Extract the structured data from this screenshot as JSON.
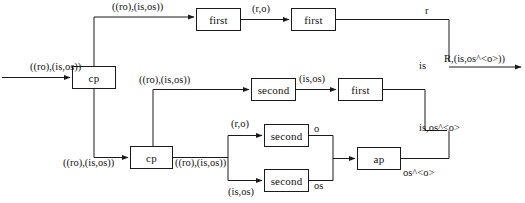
{
  "diagram": {
    "type": "dataflow",
    "stroke_color": "#1a1a1a",
    "background_color": "#ffffff",
    "nodes": [
      {
        "id": "cp1",
        "label": "cp",
        "x": 72,
        "y": 66,
        "w": 44,
        "h": 23
      },
      {
        "id": "first1",
        "label": "first",
        "x": 196,
        "y": 8,
        "w": 45,
        "h": 23
      },
      {
        "id": "first2",
        "label": "first",
        "x": 291,
        "y": 8,
        "w": 45,
        "h": 23
      },
      {
        "id": "second1",
        "label": "second",
        "x": 251,
        "y": 78,
        "w": 45,
        "h": 23
      },
      {
        "id": "first3",
        "label": "first",
        "x": 338,
        "y": 78,
        "w": 45,
        "h": 23
      },
      {
        "id": "cp2",
        "label": "cp",
        "x": 130,
        "y": 146,
        "w": 43,
        "h": 23
      },
      {
        "id": "second2",
        "label": "second",
        "x": 264,
        "y": 124,
        "w": 45,
        "h": 23
      },
      {
        "id": "second3",
        "label": "second",
        "x": 264,
        "y": 169,
        "w": 45,
        "h": 23
      },
      {
        "id": "ap",
        "label": "ap",
        "x": 357,
        "y": 147,
        "w": 44,
        "h": 23
      }
    ],
    "edge_labels": [
      {
        "id": "in-main",
        "text": "((ro),(is,os))",
        "x": 30,
        "y": 62
      },
      {
        "id": "cp1-top",
        "text": "((ro),(is,os))",
        "x": 112,
        "y": 2
      },
      {
        "id": "first1-out",
        "text": "(r,o)",
        "x": 252,
        "y": 4
      },
      {
        "id": "first2-out",
        "text": "r",
        "x": 425,
        "y": 6
      },
      {
        "id": "cp1-bottom",
        "text": "((ro),(is,os))",
        "x": 63,
        "y": 158
      },
      {
        "id": "cp2-mid",
        "text": "((ro),(is,os))",
        "x": 139,
        "y": 75
      },
      {
        "id": "second1-out",
        "text": "(is,os)",
        "x": 299,
        "y": 74
      },
      {
        "id": "first3-out",
        "text": "is",
        "x": 419,
        "y": 61
      },
      {
        "id": "cp2-out",
        "text": "((ro),(is,os))",
        "x": 175,
        "y": 158
      },
      {
        "id": "branch-top",
        "text": "(r,o)",
        "x": 231,
        "y": 119
      },
      {
        "id": "branch-bot",
        "text": "(is,os)",
        "x": 228,
        "y": 187
      },
      {
        "id": "second2-out",
        "text": "o",
        "x": 314,
        "y": 124
      },
      {
        "id": "second3-out",
        "text": "os",
        "x": 314,
        "y": 181
      },
      {
        "id": "ap-out",
        "text": "os^<o>",
        "x": 403,
        "y": 168
      },
      {
        "id": "merge-lbl",
        "text": "is,os^<o>",
        "x": 419,
        "y": 123
      },
      {
        "id": "final-out",
        "text": "R,(is,os^<o>))",
        "x": 444,
        "y": 54
      }
    ]
  }
}
